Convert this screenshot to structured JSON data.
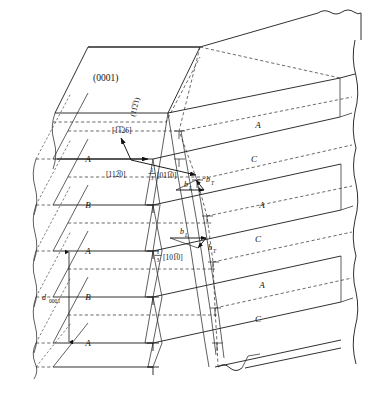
{
  "figure": {
    "kind": "crystallography-line-diagram",
    "plane_label": "(0001)",
    "habit_plane_label": "(11̅2̅1)",
    "line_direction_label": "[1̅1̅26]",
    "slip_direction_label": "[112̅0]",
    "partial_vector_top_label": "[011̅0]",
    "partial_vector_bottom_label": "[101̅0]",
    "fraction_numerator": "1",
    "fraction_denominator": "3",
    "interplanar_spacing_label": "d",
    "interplanar_spacing_subscript": "0001",
    "dislocation_symbol": "⊥",
    "burgers_vectors": [
      {
        "id": "bL-upper",
        "base": "b",
        "subscript": "L",
        "label": "b_L"
      },
      {
        "id": "bT-upper",
        "base": "b",
        "subscript": "T",
        "label": "b_T"
      },
      {
        "id": "bL-lower",
        "base": "b",
        "subscript": "L",
        "label": "b_L"
      },
      {
        "id": "bT-lower",
        "base": "b",
        "subscript": "T",
        "label": "b_T"
      }
    ],
    "stacking_labels_left": [
      {
        "label": "A",
        "y": 159
      },
      {
        "label": "B",
        "y": 205
      },
      {
        "label": "A",
        "y": 251
      },
      {
        "label": "B",
        "y": 297
      },
      {
        "label": "A",
        "y": 343
      }
    ],
    "stacking_labels_right": [
      {
        "label": "A",
        "y": 125
      },
      {
        "label": "C",
        "y": 159
      },
      {
        "label": "A",
        "y": 205
      },
      {
        "label": "C",
        "y": 239
      },
      {
        "label": "A",
        "y": 285
      },
      {
        "label": "C",
        "y": 319
      }
    ],
    "dislocation_marks_front": [
      {
        "x": 153,
        "y": 205
      },
      {
        "x": 153,
        "y": 251
      },
      {
        "x": 153,
        "y": 297
      },
      {
        "x": 153,
        "y": 343
      },
      {
        "x": 153,
        "y": 367
      }
    ],
    "dislocation_marks_back": [
      {
        "x": 179,
        "y": 131
      },
      {
        "x": 179,
        "y": 159
      },
      {
        "x": 197,
        "y": 180
      },
      {
        "x": 207,
        "y": 216
      },
      {
        "x": 213,
        "y": 262
      },
      {
        "x": 215,
        "y": 308
      },
      {
        "x": 217,
        "y": 343
      }
    ],
    "colors": {
      "line": "#1a1a1a",
      "dashed": "#2b2b2b",
      "background": "#ffffff",
      "text": "#111111"
    }
  }
}
